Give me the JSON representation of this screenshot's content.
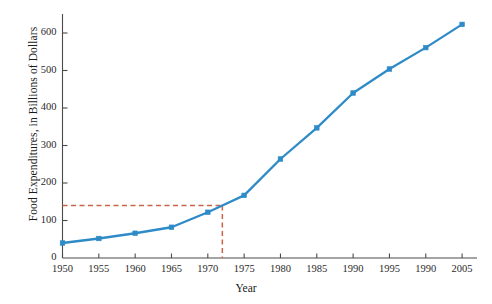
{
  "chart_data": {
    "type": "line",
    "title": "",
    "xlabel": "Year",
    "ylabel": "Food Expenditures, in Billions of Dollars",
    "x": [
      1950,
      1955,
      1960,
      1965,
      1970,
      1972,
      1975,
      1980,
      1985,
      1990,
      1995,
      2000,
      2005
    ],
    "values": [
      40,
      52,
      66,
      82,
      122,
      140,
      167,
      264,
      347,
      440,
      504,
      561,
      623
    ],
    "xticks": [
      1950,
      1955,
      1960,
      1965,
      1970,
      1975,
      1980,
      1985,
      1990,
      1995,
      2000,
      2005
    ],
    "xtick_labels": [
      "1950",
      "1955",
      "1960",
      "1965",
      "1970",
      "1975",
      "1980",
      "1985",
      "1990",
      "1995",
      "1990",
      "2005"
    ],
    "yticks": [
      0,
      100,
      200,
      300,
      400,
      500,
      600
    ],
    "ytick_labels": [
      "0",
      "100",
      "200",
      "300",
      "400",
      "500",
      "600"
    ],
    "xlim": [
      1950,
      2006.5
    ],
    "ylim": [
      0,
      640
    ],
    "grid": false,
    "legend": "none",
    "series_color": "#2e8bc7",
    "marker": "square",
    "annotations": [
      {
        "name": "guide-lines",
        "type": "dashed-crosshair",
        "y_value": 140,
        "x_value": 1972,
        "color": "#c8654a",
        "style": "dashed"
      }
    ]
  }
}
